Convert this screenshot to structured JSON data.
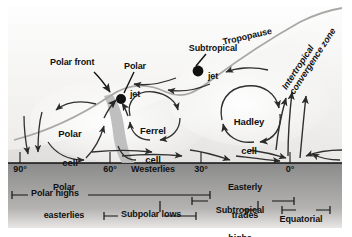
{
  "figure": {
    "type": "diagram",
    "background_color": "#f2f1ef",
    "ground_color": "#8f8f8f",
    "ink_color": "#1a1a1a",
    "jet_marker_color": "#111111",
    "polar_front_band_color": "#b9b9b9"
  },
  "cells": [
    {
      "name": "polar-cell",
      "label": "Polar\ncell",
      "line1": "Polar",
      "line2": "cell",
      "x": 70,
      "y": 118
    },
    {
      "name": "ferrel-cell",
      "label": "Ferrel\ncell",
      "line1": "Ferrel",
      "line2": "cell",
      "x": 152,
      "y": 115
    },
    {
      "name": "hadley-cell",
      "label": "Hadley\ncell",
      "line1": "Hadley",
      "line2": "cell",
      "x": 245,
      "y": 106
    }
  ],
  "annotations": [
    {
      "name": "polar-front",
      "line1": "Polar front",
      "line2": "",
      "x": 54,
      "y": 63
    },
    {
      "name": "polar-jet",
      "line1": "Polar",
      "line2": "jet",
      "x": 132,
      "y": 58
    },
    {
      "name": "subtropical-jet",
      "line1": "Subtropical",
      "line2": "jet",
      "x": 214,
      "y": 37
    },
    {
      "name": "tropopause",
      "line1": "Tropopause",
      "line2": "",
      "x": 272,
      "y": 44
    },
    {
      "name": "itcz",
      "line1": "Intertropical",
      "line2": "convergence zone",
      "x": 318,
      "y": 52
    }
  ],
  "axis": {
    "name": "latitude-axis",
    "ticks": [
      {
        "label": "90°",
        "latitude": 90,
        "x": 20
      },
      {
        "label": "60°",
        "latitude": 60,
        "x": 110
      },
      {
        "label": "30°",
        "latitude": 30,
        "x": 201
      },
      {
        "label": "0°",
        "latitude": 0,
        "x": 290
      }
    ]
  },
  "surface_winds": [
    {
      "name": "polar-easterlies",
      "line1": "Polar",
      "line2": "easterlies",
      "x": 64,
      "y": 170
    },
    {
      "name": "westerlies",
      "line1": "Westerlies",
      "line2": "",
      "x": 152,
      "y": 170
    },
    {
      "name": "easterly-trades",
      "line1": "Easterly",
      "line2": "trades",
      "x": 245,
      "y": 170
    }
  ],
  "pressure_belts": [
    {
      "name": "polar-highs",
      "label": "Polar highs",
      "text_x": 38,
      "text_y": 192,
      "bracket": {
        "x1": 12,
        "x2": 28,
        "y": 195
      }
    },
    {
      "name": "subpolar-lows",
      "label": "Subpolar lows",
      "text_x": 140,
      "text_y": 213,
      "bracket": {
        "x1": 104,
        "x2": 118,
        "y": 216
      }
    },
    {
      "name": "subtropical-highs",
      "label": "Subtropical\nhighs",
      "line1": "Subtropical",
      "line2": "highs",
      "text_x": 236,
      "text_y": 191,
      "bracket": {
        "x1": 192,
        "x2": 208,
        "y": 194
      }
    },
    {
      "name": "equatorial-low",
      "label": "Equatorial\nlow",
      "line1": "Equatorial",
      "line2": "low",
      "text_x": 300,
      "text_y": 207,
      "bracket": {
        "x1": 282,
        "x2": 296,
        "y": 210
      }
    }
  ],
  "scalebars": [
    {
      "name": "polar-highs-span-bar",
      "x1": 88,
      "x2": 210,
      "y": 195
    },
    {
      "name": "subtropical-highs-bar",
      "x1": 272,
      "x2": 294,
      "y": 201
    },
    {
      "name": "subpolar-lows-left-bar",
      "x1": 58,
      "x2": 104,
      "y": 205
    },
    {
      "name": "subpolar-lows-right-bar",
      "x1": 164,
      "x2": 196,
      "y": 216
    },
    {
      "name": "equatorial-low-bar",
      "x1": 243,
      "x2": 282,
      "y": 210
    }
  ]
}
